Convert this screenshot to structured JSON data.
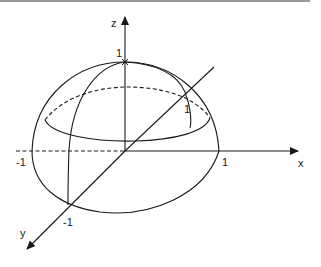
{
  "figure": {
    "axes": {
      "x": {
        "label": "x",
        "ticks": [
          "-1",
          "1"
        ]
      },
      "y": {
        "label": "y",
        "ticks": [
          "-1",
          "1"
        ]
      },
      "z": {
        "label": "z",
        "ticks": [
          "1"
        ]
      }
    },
    "colors": {
      "stroke": "#1a1a1a",
      "background": "#ffffff"
    }
  }
}
